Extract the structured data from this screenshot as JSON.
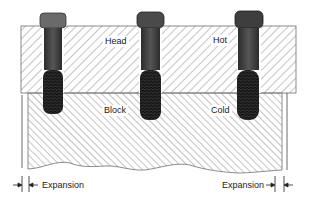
{
  "diagram": {
    "labels": {
      "head": "Head",
      "hot": "Hot",
      "block": "Block",
      "cold": "Cold",
      "expansion_left": "Expansion",
      "expansion_right": "Expansion"
    },
    "components": {
      "head": {
        "x": 21,
        "y": 26,
        "width": 275,
        "height": 67,
        "hatch": "forward"
      },
      "block": {
        "x": 28,
        "y": 93,
        "width": 254,
        "height": 80,
        "hatch": "backward",
        "bottom_edge": "wavy"
      },
      "bolts": [
        {
          "name": "bolt-1",
          "x": 41,
          "width": 24
        },
        {
          "name": "bolt-2",
          "x": 138,
          "width": 25
        },
        {
          "name": "bolt-3",
          "x": 236,
          "width": 26
        }
      ]
    },
    "colors": {
      "hatch": "#8a8a8a",
      "outline": "#6e6e6e",
      "bolt": "#3a3a3a",
      "bolt_thread": "#1e1e1e",
      "background": "#ffffff"
    }
  }
}
